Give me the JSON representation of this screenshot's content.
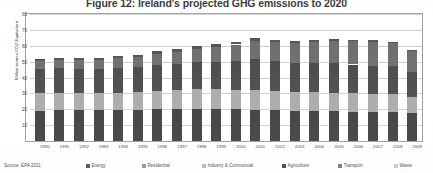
{
  "title": "Figure 12: Ireland's projected GHG emissions to 2020",
  "source_note": "Source: EPA 2011",
  "chart_data": {
    "type": "bar",
    "stacked": true,
    "title": "Figure 12: Ireland's projected GHG emissions to 2020",
    "xlabel": "",
    "ylabel": "Million tonnes CO2 Equivalent",
    "ylim": [
      0,
      80
    ],
    "yticks": [
      0,
      10,
      20,
      30,
      40,
      50,
      60,
      70,
      80
    ],
    "ytick_labels": [
      "0",
      "10",
      "20",
      "30",
      "40",
      "50",
      "60",
      "70",
      "80"
    ],
    "grid": true,
    "legend_position": "bottom",
    "categories": [
      "1990",
      "1991",
      "1992",
      "1993",
      "1994",
      "1995",
      "1996",
      "1997",
      "1998",
      "1999",
      "2000",
      "2001",
      "2002",
      "2003",
      "2004",
      "2005",
      "2006",
      "2007",
      "2008",
      "2009"
    ],
    "series": [
      {
        "name": "Energy",
        "color": "#4a4a4a",
        "values": [
          11.3,
          11.4,
          11.2,
          11.3,
          11.5,
          11.8,
          12.3,
          12.6,
          13.2,
          13.6,
          14.4,
          15.6,
          15.1,
          14.6,
          14.7,
          15.1,
          14.8,
          14.4,
          14.2,
          12.4
        ]
      },
      {
        "name": "Residential",
        "color": "#8e8e8e",
        "values": [
          7.4,
          7.5,
          7.2,
          7.3,
          7.2,
          7.0,
          7.5,
          7.1,
          7.0,
          6.8,
          6.6,
          7.1,
          6.6,
          6.6,
          6.5,
          6.4,
          6.2,
          6.1,
          6.4,
          6.2
        ]
      },
      {
        "name": "Industry & Commercial",
        "color": "#b4b4b4",
        "values": [
          7.6,
          7.6,
          7.6,
          7.7,
          7.9,
          8.1,
          8.3,
          8.6,
          9.0,
          9.1,
          9.2,
          9.4,
          9.2,
          9.1,
          9.0,
          8.9,
          8.8,
          8.6,
          8.3,
          7.2
        ]
      },
      {
        "name": "Agriculture",
        "color": "#3a3a3a",
        "values": [
          19.2,
          19.4,
          19.4,
          19.3,
          19.4,
          19.6,
          20.0,
          20.3,
          20.4,
          20.3,
          20.0,
          19.8,
          19.4,
          19.0,
          18.8,
          18.6,
          18.4,
          18.3,
          18.2,
          17.8
        ]
      },
      {
        "name": "Transport",
        "color": "#6e6e6e",
        "values": [
          5.1,
          5.2,
          5.4,
          5.6,
          6.0,
          6.4,
          7.0,
          7.7,
          8.6,
          9.6,
          10.6,
          11.4,
          12.0,
          12.5,
          13.2,
          13.9,
          14.6,
          15.2,
          14.5,
          13.0
        ]
      },
      {
        "name": "Waste",
        "color": "#c8c8c8",
        "values": [
          1.3,
          1.3,
          1.3,
          1.3,
          1.4,
          1.4,
          1.4,
          1.4,
          1.4,
          1.4,
          1.4,
          1.4,
          1.3,
          1.3,
          1.2,
          1.2,
          1.1,
          1.1,
          1.0,
          1.0
        ]
      }
    ],
    "totals": [
      51.9,
      52.4,
      52.1,
      52.5,
      53.4,
      54.3,
      56.5,
      57.7,
      59.6,
      60.8,
      62.2,
      64.7,
      63.6,
      63.1,
      63.4,
      64.1,
      63.9,
      63.7,
      62.6,
      57.6
    ]
  }
}
